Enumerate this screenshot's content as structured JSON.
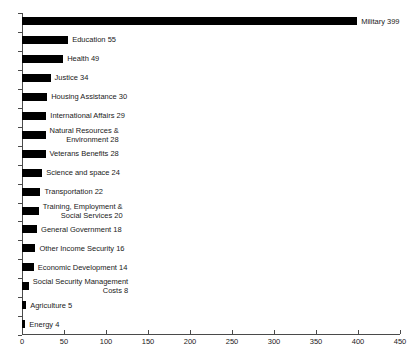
{
  "chart_data": {
    "type": "bar",
    "orientation": "horizontal",
    "title": "",
    "subtitle": "",
    "xlabel": "",
    "ylabel": "",
    "xlim": [
      0,
      450
    ],
    "xticks": [
      0,
      50,
      100,
      150,
      200,
      250,
      300,
      350,
      400,
      450
    ],
    "xtick_labels": [
      "0",
      "50",
      "100",
      "150",
      "200",
      "250",
      "300",
      "350",
      "400",
      "450"
    ],
    "grid": false,
    "legend": false,
    "bar_color": "#000000",
    "axis_color": "#4a4a4a",
    "categories": [
      "Military",
      "Education",
      "Health",
      "Justice",
      "Housing Assistance",
      "International Affairs",
      "Natural Resources & Environment",
      "Veterans Benefits",
      "Science and space",
      "Transportation",
      "Training, Employment & Social Services",
      "General Government",
      "Other Income Security",
      "Economic Development",
      "Social Security Management Costs",
      "Agriculture",
      "Energy"
    ],
    "values": [
      399,
      55,
      49,
      34,
      30,
      29,
      28,
      28,
      24,
      22,
      20,
      18,
      16,
      14,
      8,
      5,
      4
    ],
    "data_labels": [
      "Military 399",
      "Education 55",
      "Health 49",
      "Justice 34",
      "Housing Assistance 30",
      "International Affairs 29",
      "Natural Resources &\nEnvironment 28",
      "Veterans Benefits 28",
      "Science and space 24",
      "Transportation 22",
      "Training, Employment &\nSocial Services 20",
      "General Government 18",
      "Other Income Security 16",
      "Economic Development 14",
      "Social Security Management\nCosts 8",
      "Agriculture 5",
      "Energy 4"
    ],
    "bars": [
      {
        "name": "military",
        "label": "Military 399",
        "line1": "Military 399",
        "line2": "",
        "value": 399,
        "lines": 1
      },
      {
        "name": "education",
        "label": "Education 55",
        "line1": "Education 55",
        "line2": "",
        "value": 55,
        "lines": 1
      },
      {
        "name": "health",
        "label": "Health 49",
        "line1": "Health 49",
        "line2": "",
        "value": 49,
        "lines": 1
      },
      {
        "name": "justice",
        "label": "Justice 34",
        "line1": "Justice 34",
        "line2": "",
        "value": 34,
        "lines": 1
      },
      {
        "name": "housing-assistance",
        "label": "Housing Assistance 30",
        "line1": "Housing Assistance 30",
        "line2": "",
        "value": 30,
        "lines": 1
      },
      {
        "name": "international-affairs",
        "label": "International Affairs 29",
        "line1": "International Affairs 29",
        "line2": "",
        "value": 29,
        "lines": 1
      },
      {
        "name": "natural-resources-environment",
        "label": "Natural Resources & Environment 28",
        "line1": "Natural Resources &",
        "line2": "Environment 28",
        "value": 28,
        "lines": 2
      },
      {
        "name": "veterans-benefits",
        "label": "Veterans Benefits 28",
        "line1": "Veterans Benefits 28",
        "line2": "",
        "value": 28,
        "lines": 1
      },
      {
        "name": "science-and-space",
        "label": "Science and space 24",
        "line1": "Science and space 24",
        "line2": "",
        "value": 24,
        "lines": 1
      },
      {
        "name": "transportation",
        "label": "Transportation 22",
        "line1": "Transportation 22",
        "line2": "",
        "value": 22,
        "lines": 1
      },
      {
        "name": "training-employment-social",
        "label": "Training, Employment & Social Services 20",
        "line1": "Training, Employment &",
        "line2": "Social Services 20",
        "value": 20,
        "lines": 2
      },
      {
        "name": "general-government",
        "label": "General Government 18",
        "line1": "General Government 18",
        "line2": "",
        "value": 18,
        "lines": 1
      },
      {
        "name": "other-income-security",
        "label": "Other Income Security 16",
        "line1": "Other Income Security 16",
        "line2": "",
        "value": 16,
        "lines": 1
      },
      {
        "name": "economic-development",
        "label": "Economic Development 14",
        "line1": "Economic Development 14",
        "line2": "",
        "value": 14,
        "lines": 1
      },
      {
        "name": "social-security-management",
        "label": "Social Security Management Costs 8",
        "line1": "Social Security Management",
        "line2": "Costs 8",
        "value": 8,
        "lines": 2
      },
      {
        "name": "agriculture",
        "label": "Agriculture 5",
        "line1": "Agriculture 5",
        "line2": "",
        "value": 5,
        "lines": 1
      },
      {
        "name": "energy",
        "label": "Energy 4",
        "line1": "Energy 4",
        "line2": "",
        "value": 4,
        "lines": 1
      }
    ]
  }
}
